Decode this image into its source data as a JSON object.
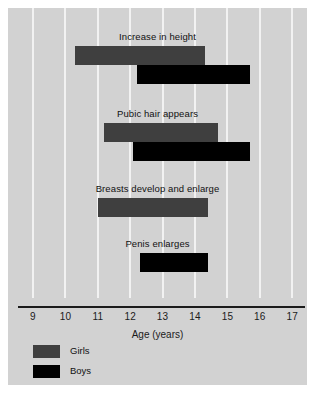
{
  "chart_data": {
    "type": "bar",
    "orientation": "horizontal",
    "title": "",
    "xlabel": "Age (years)",
    "ylabel": "",
    "xlim": [
      8.5,
      17.5
    ],
    "xticks": [
      9,
      10,
      11,
      12,
      13,
      14,
      15,
      16,
      17
    ],
    "grid": "vertical",
    "legend_position": "bottom-left",
    "legend": [
      {
        "name": "Girls",
        "color": "#3f3f3f"
      },
      {
        "name": "Boys",
        "color": "#000000"
      }
    ],
    "groups": [
      {
        "label": "Increase in height",
        "bars": [
          {
            "series": "Girls",
            "start": 10.3,
            "end": 14.3
          },
          {
            "series": "Boys",
            "start": 12.2,
            "end": 15.7
          }
        ]
      },
      {
        "label": "Pubic hair appears",
        "bars": [
          {
            "series": "Girls",
            "start": 11.2,
            "end": 14.7
          },
          {
            "series": "Boys",
            "start": 12.1,
            "end": 15.7
          }
        ]
      },
      {
        "label": "Breasts develop and enlarge",
        "bars": [
          {
            "series": "Girls",
            "start": 11.0,
            "end": 14.4
          }
        ]
      },
      {
        "label": "Penis enlarges",
        "bars": [
          {
            "series": "Boys",
            "start": 12.3,
            "end": 14.4
          }
        ]
      }
    ]
  },
  "axis": {
    "title": "Age (years)",
    "ticks": [
      "9",
      "10",
      "11",
      "12",
      "13",
      "14",
      "15",
      "16",
      "17"
    ]
  },
  "groups": [
    {
      "label": "Increase in height"
    },
    {
      "label": "Pubic hair appears"
    },
    {
      "label": "Breasts develop and enlarge"
    },
    {
      "label": "Penis enlarges"
    }
  ],
  "legend": {
    "girls_label": "Girls",
    "boys_label": "Boys"
  },
  "colors": {
    "girls": "#3f3f3f",
    "boys": "#000000",
    "panel": "#d2d2d2",
    "gridline": "#f2f2f2",
    "axis": "#1b1b1b"
  }
}
